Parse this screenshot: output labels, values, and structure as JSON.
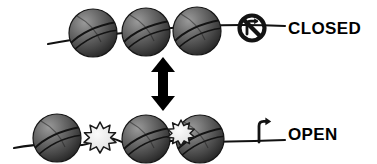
{
  "figure": {
    "background_color": "#ffffff",
    "title": "",
    "states": [
      {
        "id": "closed",
        "label": "CLOSED",
        "label_x": 288,
        "label_y": 20,
        "description": "Compacted chromatin with three closely spaced nucleosomes on DNA and a crossed-out transcription arrow indicating transcription is blocked.",
        "transcription_icon": "no-transcription-icon",
        "transcription_allowed": false,
        "nucleosome_count": 3,
        "modification_count": 0,
        "nucleosomes": [
          {
            "cx": 93,
            "cy": 33,
            "r": 24
          },
          {
            "cx": 146,
            "cy": 32,
            "r": 24
          },
          {
            "cx": 197,
            "cy": 31,
            "r": 24
          }
        ],
        "dna_path": "M 48,44 C 80,38 120,33 160,29 C 200,25 245,24 285,26",
        "icon": {
          "cx": 252,
          "cy": 28,
          "r": 13
        }
      },
      {
        "id": "open",
        "label": "OPEN",
        "label_x": 288,
        "label_y": 126,
        "description": "Decondensed chromatin with three widely spaced nucleosomes, two starburst histone modification marks, and an active transcription start arrow.",
        "transcription_icon": "transcription-arrow-icon",
        "transcription_allowed": true,
        "nucleosome_count": 3,
        "modification_count": 2,
        "nucleosomes": [
          {
            "cx": 57,
            "cy": 138,
            "r": 24
          },
          {
            "cx": 146,
            "cy": 139,
            "r": 24
          },
          {
            "cx": 200,
            "cy": 139,
            "r": 24
          }
        ],
        "modifications": [
          {
            "cx": 100,
            "cy": 136,
            "r": 13,
            "name": "histone-modification-starburst"
          },
          {
            "cx": 180,
            "cy": 131,
            "r": 11,
            "name": "histone-modification-starburst"
          }
        ],
        "dna_path": "M 14,148 C 40,143 60,142 80,144 C 92,145 96,140 104,139 C 116,137 124,145 136,145 C 150,145 160,144 170,141 C 178,139 184,141 194,141 C 214,141 250,140 285,139",
        "icon": {
          "x": 256,
          "y": 120
        }
      }
    ],
    "transition_arrow": {
      "name": "double-headed-vertical-arrow",
      "x": 163,
      "y_top": 58,
      "y_bottom": 110,
      "description": "Double-headed vertical arrow indicating reversible transition between the closed and open chromatin states."
    },
    "colors": {
      "nucleosome_light": "#8a8a8a",
      "nucleosome_mid": "#5a5a5a",
      "nucleosome_dark": "#2e2e2e",
      "nucleosome_edge": "#1a1a1a",
      "dna_line": "#111111",
      "starburst_fill": "#ededed",
      "starburst_edge": "#1a1a1a",
      "label_text": "#000000",
      "arrow": "#000000",
      "background": "#ffffff"
    }
  }
}
